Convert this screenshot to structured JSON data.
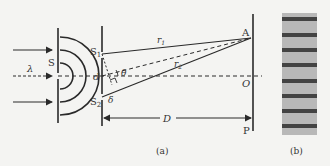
{
  "figure": {
    "panel_a": {
      "caption": "(a)",
      "labels": {
        "wavelength": "λ",
        "source": "S",
        "slit1": "S",
        "slit1_sub": "1",
        "slit2": "S",
        "slit2_sub": "2",
        "slit_separation": "d",
        "point": "A",
        "origin": "O",
        "screen": "P",
        "path1": "r",
        "path1_sub": "1",
        "path2": "r",
        "path2_sub": "2",
        "angle": "θ",
        "path_difference": "δ",
        "distance": "D"
      }
    },
    "panel_b": {
      "caption": "(b)",
      "fringe_count": 8
    }
  },
  "colors": {
    "line": "#2a2a2a",
    "background": "#f4f4f2",
    "fringe_dark": "#2e2e2e",
    "fringe_light": "#b8b8b8"
  }
}
